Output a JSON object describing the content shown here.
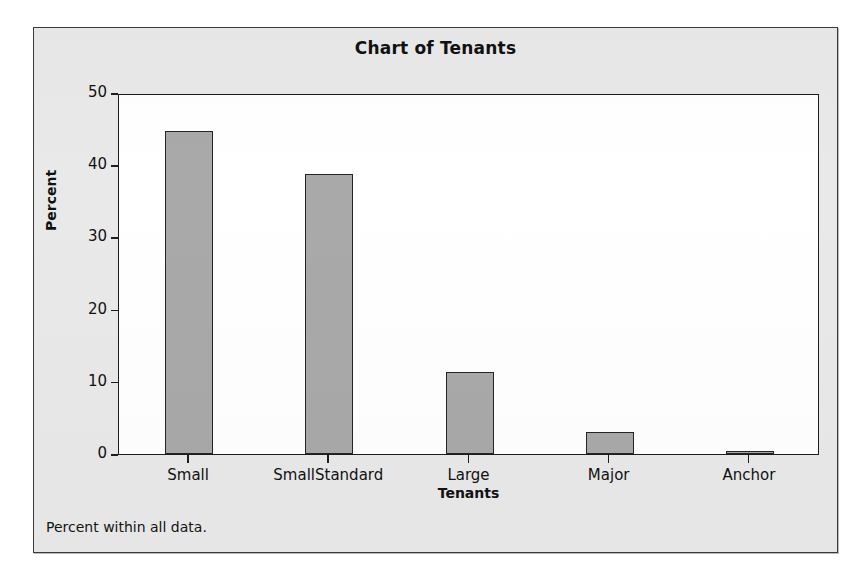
{
  "chart_data": {
    "type": "bar",
    "title": "Chart of Tenants",
    "xlabel": "Tenants",
    "ylabel": "Percent",
    "categories": [
      "Small",
      "SmallStandard",
      "Large",
      "Major",
      "Anchor"
    ],
    "values": [
      44.8,
      38.8,
      11.4,
      3.0,
      0.4
    ],
    "ylim": [
      0,
      50
    ],
    "yticks": [
      0,
      10,
      20,
      30,
      40,
      50
    ],
    "ytick_labels": [
      "0",
      "10",
      "20",
      "30",
      "40",
      "50"
    ],
    "grid": false,
    "legend": "none",
    "footnote": "Percent within all data.",
    "bar_fill_color": "#a9a9a9",
    "bar_edge_color": "#242424",
    "plot_background": "#ffffff",
    "panel_background": "#e9e9e9",
    "text_color": "#111111"
  }
}
